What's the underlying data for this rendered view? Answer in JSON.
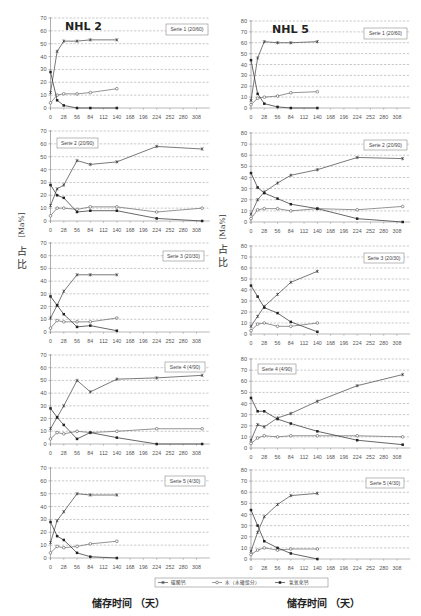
{
  "figure": {
    "panels": [
      {
        "title": "NHL 2"
      },
      {
        "title": "NHL 5"
      }
    ],
    "y_axis_label": {
      "unit": "[Ma%]",
      "char_top": "占",
      "char_bottom": "比"
    },
    "x_axis_label": "储存时间 （天）",
    "legend": [
      {
        "label": "碳酸钙",
        "marker": "asterisk-icon"
      },
      {
        "label": "水（水硬组分）",
        "marker": "circle-icon"
      },
      {
        "label": "氢氧化钙",
        "marker": "square-icon"
      }
    ],
    "colors": {
      "series_line": "#4a4a4a",
      "grid": "#9a9a9a",
      "axis": "#8a8a8a",
      "tick_text": "#555555"
    }
  },
  "chart_data": [
    {
      "type": "line",
      "panel": "NHL 2",
      "title": "Serie 1 (20/60)",
      "xlabel": "储存时间 （天）",
      "ylabel": "占比 [Ma%]",
      "xlim": [
        0,
        336
      ],
      "ylim": [
        0,
        70
      ],
      "xticks": [
        0,
        28,
        56,
        84,
        112,
        140,
        168,
        196,
        224,
        252,
        280,
        308
      ],
      "yticks": [
        0,
        10,
        20,
        30,
        40,
        50,
        60,
        70
      ],
      "grid": true,
      "legend_position": "upper right",
      "x": [
        0,
        14,
        28,
        56,
        84,
        140
      ],
      "series": [
        {
          "name": "碳酸钙",
          "values": [
            12,
            44,
            52,
            52,
            53,
            53
          ]
        },
        {
          "name": "水（水硬组分）",
          "values": [
            4,
            10,
            11,
            11,
            12,
            15
          ]
        },
        {
          "name": "氢氧化钙",
          "values": [
            28,
            6,
            2,
            0,
            0,
            0
          ]
        }
      ]
    },
    {
      "type": "line",
      "panel": "NHL 2",
      "title": "Serie 2 (20/90)",
      "xlabel": "储存时间 （天）",
      "ylabel": "占比 [Ma%]",
      "xlim": [
        0,
        336
      ],
      "ylim": [
        0,
        70
      ],
      "xticks": [
        0,
        28,
        56,
        84,
        112,
        140,
        168,
        196,
        224,
        252,
        280,
        308
      ],
      "yticks": [
        0,
        10,
        20,
        30,
        40,
        50,
        60,
        70
      ],
      "grid": true,
      "legend_position": "upper left",
      "x": [
        0,
        14,
        28,
        56,
        84,
        140,
        224,
        320
      ],
      "series": [
        {
          "name": "碳酸钙",
          "values": [
            12,
            25,
            28,
            47,
            44,
            46,
            58,
            56
          ]
        },
        {
          "name": "水（水硬组分）",
          "values": [
            4,
            10,
            10,
            9,
            11,
            11,
            7,
            10
          ]
        },
        {
          "name": "氢氧化钙",
          "values": [
            28,
            20,
            18,
            7,
            8,
            8,
            2,
            0
          ]
        }
      ]
    },
    {
      "type": "line",
      "panel": "NHL 2",
      "title": "Serie 3 (20/30)",
      "xlabel": "储存时间 （天）",
      "ylabel": "占比 [Ma%]",
      "xlim": [
        0,
        336
      ],
      "ylim": [
        0,
        70
      ],
      "xticks": [
        0,
        28,
        56,
        84,
        112,
        140,
        168,
        196,
        224,
        252,
        280,
        308
      ],
      "yticks": [
        0,
        10,
        20,
        30,
        40,
        50,
        60,
        70
      ],
      "grid": true,
      "legend_position": "upper right",
      "x": [
        0,
        14,
        28,
        56,
        84,
        140
      ],
      "series": [
        {
          "name": "碳酸钙",
          "values": [
            11,
            21,
            32,
            45,
            45,
            45
          ]
        },
        {
          "name": "水（水硬组分）",
          "values": [
            3,
            9,
            8,
            8,
            8,
            11
          ]
        },
        {
          "name": "氢氧化钙",
          "values": [
            28,
            21,
            14,
            4,
            5,
            1
          ]
        }
      ]
    },
    {
      "type": "line",
      "panel": "NHL 2",
      "title": "Serie 4 (4/90)",
      "xlabel": "储存时间 （天）",
      "ylabel": "占比 [Ma%]",
      "xlim": [
        0,
        336
      ],
      "ylim": [
        0,
        70
      ],
      "xticks": [
        0,
        28,
        56,
        84,
        112,
        140,
        168,
        196,
        224,
        252,
        280,
        308
      ],
      "yticks": [
        0,
        10,
        20,
        30,
        40,
        50,
        60,
        70
      ],
      "grid": true,
      "legend_position": "upper right",
      "x": [
        0,
        14,
        28,
        56,
        84,
        140,
        224,
        320
      ],
      "series": [
        {
          "name": "碳酸钙",
          "values": [
            12,
            21,
            30,
            50,
            41,
            51,
            52,
            54
          ]
        },
        {
          "name": "水（水硬组分）",
          "values": [
            4,
            9,
            8,
            10,
            9,
            10,
            12,
            12
          ]
        },
        {
          "name": "氢氧化钙",
          "values": [
            28,
            21,
            15,
            4,
            9,
            5,
            0,
            0
          ]
        }
      ]
    },
    {
      "type": "line",
      "panel": "NHL 2",
      "title": "Serie 5 (4/30)",
      "xlabel": "储存时间 （天）",
      "ylabel": "占比 [Ma%]",
      "xlim": [
        0,
        336
      ],
      "ylim": [
        0,
        70
      ],
      "xticks": [
        0,
        28,
        56,
        84,
        112,
        140,
        168,
        196,
        224,
        252,
        280,
        308
      ],
      "yticks": [
        0,
        10,
        20,
        30,
        40,
        50,
        60,
        70
      ],
      "grid": true,
      "legend_position": "upper right",
      "x": [
        0,
        14,
        28,
        56,
        84,
        140
      ],
      "series": [
        {
          "name": "碳酸钙",
          "values": [
            12,
            29,
            36,
            50,
            49,
            49
          ]
        },
        {
          "name": "水（水硬组分）",
          "values": [
            4,
            9,
            8,
            9,
            11,
            13
          ]
        },
        {
          "name": "氢氧化钙",
          "values": [
            28,
            17,
            14,
            4,
            1,
            0
          ]
        }
      ]
    },
    {
      "type": "line",
      "panel": "NHL 5",
      "title": "Serie 1 (20/60)",
      "xlabel": "储存时间 （天）",
      "ylabel": "占比 [Ma%]",
      "xlim": [
        0,
        336
      ],
      "ylim": [
        0,
        80
      ],
      "xticks": [
        0,
        28,
        56,
        84,
        112,
        140,
        168,
        196,
        224,
        252,
        280,
        308
      ],
      "yticks": [
        0,
        10,
        20,
        30,
        40,
        50,
        60,
        70,
        80
      ],
      "grid": true,
      "legend_position": "upper right",
      "x": [
        0,
        14,
        28,
        56,
        84,
        140
      ],
      "series": [
        {
          "name": "碳酸钙",
          "values": [
            7,
            46,
            61,
            60,
            60,
            61
          ]
        },
        {
          "name": "水（水硬组分）",
          "values": [
            3,
            9,
            10,
            11,
            14,
            15
          ]
        },
        {
          "name": "氢氧化钙",
          "values": [
            44,
            13,
            4,
            1,
            0,
            0
          ]
        }
      ]
    },
    {
      "type": "line",
      "panel": "NHL 5",
      "title": "Serie 2 (20/90)",
      "xlabel": "储存时间 （天）",
      "ylabel": "占比 [Ma%]",
      "xlim": [
        0,
        336
      ],
      "ylim": [
        0,
        80
      ],
      "xticks": [
        0,
        28,
        56,
        84,
        112,
        140,
        168,
        196,
        224,
        252,
        280,
        308
      ],
      "yticks": [
        0,
        10,
        20,
        30,
        40,
        50,
        60,
        70,
        80
      ],
      "grid": true,
      "legend_position": "upper right",
      "x": [
        0,
        14,
        28,
        56,
        84,
        140,
        224,
        320
      ],
      "series": [
        {
          "name": "碳酸钙",
          "values": [
            7,
            20,
            27,
            35,
            42,
            47,
            58,
            57
          ]
        },
        {
          "name": "水（水硬组分）",
          "values": [
            3,
            11,
            12,
            12,
            10,
            12,
            11,
            14
          ]
        },
        {
          "name": "氢氧化钙",
          "values": [
            44,
            31,
            26,
            21,
            16,
            12,
            3,
            0
          ]
        }
      ]
    },
    {
      "type": "line",
      "panel": "NHL 5",
      "title": "Serie 3 (20/30)",
      "xlabel": "储存时间 （天）",
      "ylabel": "占比 [Ma%]",
      "xlim": [
        0,
        336
      ],
      "ylim": [
        0,
        80
      ],
      "xticks": [
        0,
        28,
        56,
        84,
        112,
        140,
        168,
        196,
        224,
        252,
        280,
        308
      ],
      "yticks": [
        0,
        10,
        20,
        30,
        40,
        50,
        60,
        70,
        80
      ],
      "grid": true,
      "legend_position": "upper right",
      "x": [
        0,
        14,
        28,
        56,
        84,
        140
      ],
      "series": [
        {
          "name": "碳酸钙",
          "values": [
            7,
            16,
            25,
            36,
            47,
            57
          ]
        },
        {
          "name": "水（水硬组分）",
          "values": [
            3,
            9,
            10,
            7,
            7,
            10
          ]
        },
        {
          "name": "氢氧化钙",
          "values": [
            44,
            34,
            24,
            19,
            11,
            2
          ]
        }
      ]
    },
    {
      "type": "line",
      "panel": "NHL 5",
      "title": "Serie 4 (4/90)",
      "xlabel": "储存时间 （天）",
      "ylabel": "占比 [Ma%]",
      "xlim": [
        0,
        336
      ],
      "ylim": [
        0,
        80
      ],
      "xticks": [
        0,
        28,
        56,
        84,
        112,
        140,
        168,
        196,
        224,
        252,
        280,
        308
      ],
      "yticks": [
        0,
        10,
        20,
        30,
        40,
        50,
        60,
        70,
        80
      ],
      "grid": true,
      "legend_position": "upper left",
      "x": [
        0,
        14,
        28,
        56,
        84,
        140,
        224,
        320
      ],
      "series": [
        {
          "name": "碳酸钙",
          "values": [
            7,
            21,
            19,
            27,
            31,
            42,
            56,
            66
          ]
        },
        {
          "name": "水（水硬组分）",
          "values": [
            4,
            9,
            11,
            10,
            11,
            11,
            11,
            10
          ]
        },
        {
          "name": "氢氧化钙",
          "values": [
            45,
            33,
            33,
            26,
            22,
            15,
            7,
            3
          ]
        }
      ]
    },
    {
      "type": "line",
      "panel": "NHL 5",
      "title": "Serie 5 (4/30)",
      "xlabel": "储存时间 （天）",
      "ylabel": "占比 [Ma%]",
      "xlim": [
        0,
        336
      ],
      "ylim": [
        0,
        80
      ],
      "xticks": [
        0,
        28,
        56,
        84,
        112,
        140,
        168,
        196,
        224,
        252,
        280,
        308
      ],
      "yticks": [
        0,
        10,
        20,
        30,
        40,
        50,
        60,
        70,
        80
      ],
      "grid": true,
      "legend_position": "upper right",
      "x": [
        0,
        14,
        28,
        56,
        84,
        140
      ],
      "series": [
        {
          "name": "碳酸钙",
          "values": [
            7,
            24,
            38,
            49,
            57,
            59
          ]
        },
        {
          "name": "水（水硬组分）",
          "values": [
            4,
            8,
            10,
            8,
            9,
            9
          ]
        },
        {
          "name": "氢氧化钙",
          "values": [
            44,
            30,
            16,
            10,
            5,
            0
          ]
        }
      ]
    }
  ]
}
